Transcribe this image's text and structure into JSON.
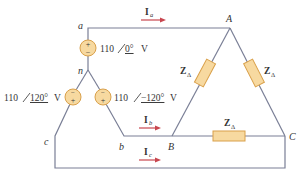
{
  "colors": {
    "wire": "#7a7f96",
    "source_fill": "#f7d9a0",
    "source_stroke": "#d9a04a",
    "impedance_fill": "#f7d9a0",
    "impedance_stroke": "#d9a04a",
    "arrow": "#c8464f",
    "text": "#333333"
  },
  "nodes": {
    "a": "a",
    "n": "n",
    "b": "b",
    "c": "c",
    "A": "A",
    "B": "B",
    "C": "C"
  },
  "sources": {
    "va": {
      "magnitude": "110",
      "angle": "0°",
      "unit": "V"
    },
    "vb": {
      "magnitude": "110",
      "angle": "−120°",
      "unit": "V"
    },
    "vc": {
      "magnitude": "110",
      "angle": "120°",
      "unit": "V"
    }
  },
  "currents": {
    "Ia": {
      "symbol": "I",
      "sub": "a"
    },
    "Ib": {
      "symbol": "I",
      "sub": "b"
    },
    "Ic": {
      "symbol": "I",
      "sub": "c"
    }
  },
  "impedances": {
    "ZAB": {
      "symbol": "Z",
      "sub": "Δ"
    },
    "ZAC": {
      "symbol": "Z",
      "sub": "Δ"
    },
    "ZBC": {
      "symbol": "Z",
      "sub": "Δ"
    }
  },
  "polarity": {
    "plus": "+",
    "minus": "−"
  }
}
